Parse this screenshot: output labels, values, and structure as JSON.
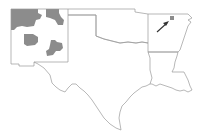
{
  "map": {
    "title": "",
    "region": "South-central United States",
    "states_outlined": [
      "New Mexico",
      "Texas",
      "Oklahoma",
      "Arkansas",
      "Louisiana"
    ],
    "highlighted_areas": [
      {
        "state": "New Mexico",
        "description": "northwest shaded counties"
      },
      {
        "state": "New Mexico",
        "description": "north-central shaded counties"
      },
      {
        "state": "New Mexico",
        "description": "central-west shaded county"
      },
      {
        "state": "New Mexico",
        "description": "south-central shaded counties"
      },
      {
        "state": "Arkansas",
        "description": "single shaded county in north, indicated by arrow"
      }
    ],
    "colors": {
      "border": "#9a9a9a",
      "shaded": "#8c8c8c",
      "arrow": "#333333",
      "background": "#ffffff"
    },
    "annotation": {
      "type": "arrow",
      "points_to": "Arkansas shaded county"
    }
  }
}
